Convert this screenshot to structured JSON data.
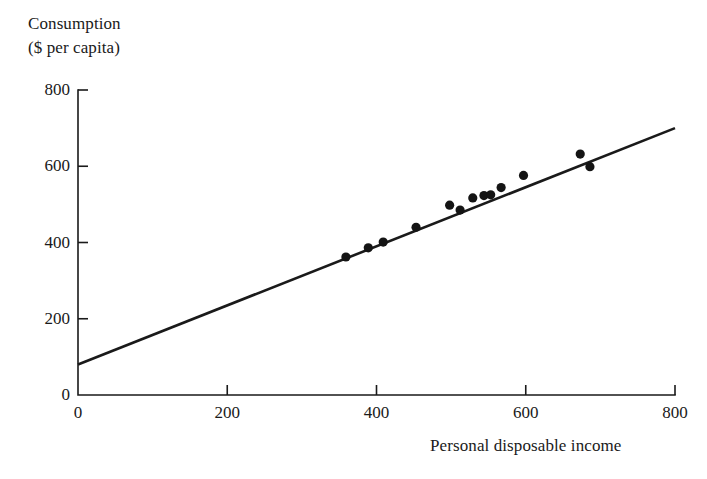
{
  "figure": {
    "background_color": "#ffffff",
    "ink_color": "#1a1a1a"
  },
  "axes": {
    "y_title_line1": "Consumption",
    "y_title_line2": "($ per capita)",
    "x_title": "Personal disposable income",
    "y_ticks": [
      "0",
      "200",
      "400",
      "600",
      "800"
    ],
    "x_ticks": [
      "0",
      "200",
      "400",
      "600",
      "800"
    ]
  },
  "chart_data": {
    "type": "scatter",
    "title": "",
    "subtitle": "",
    "xlabel": "Personal disposable income",
    "ylabel": "Consumption ($ per capita)",
    "xlim": [
      0,
      800
    ],
    "ylim": [
      0,
      800
    ],
    "xticks": [
      0,
      200,
      400,
      600,
      800
    ],
    "yticks": [
      0,
      200,
      400,
      600,
      800
    ],
    "grid": false,
    "legend": "none",
    "series": [
      {
        "name": "Observations",
        "marker": "filled-circle",
        "color": "#141414",
        "points": [
          {
            "x": 359,
            "y": 362
          },
          {
            "x": 389,
            "y": 386
          },
          {
            "x": 409,
            "y": 401
          },
          {
            "x": 453,
            "y": 440
          },
          {
            "x": 498,
            "y": 498
          },
          {
            "x": 512,
            "y": 485
          },
          {
            "x": 529,
            "y": 517
          },
          {
            "x": 544,
            "y": 523
          },
          {
            "x": 553,
            "y": 525
          },
          {
            "x": 567,
            "y": 544
          },
          {
            "x": 597,
            "y": 576
          },
          {
            "x": 673,
            "y": 632
          },
          {
            "x": 686,
            "y": 599
          }
        ]
      }
    ],
    "fit_line": {
      "name": "Regression line",
      "color": "#1a1a1a",
      "x_start": 0,
      "y_start": 80,
      "x_end": 800,
      "y_end": 700,
      "intercept": 80,
      "slope": 0.775
    },
    "annotations": []
  }
}
